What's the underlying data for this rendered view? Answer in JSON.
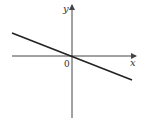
{
  "diagram": {
    "type": "coordinate-graph",
    "axes": {
      "x_label": "x",
      "y_label": "y",
      "origin_label": "0"
    },
    "line": {
      "passes_through_origin": true,
      "slope_sign": "negative"
    },
    "colors": {
      "axis": "#444444",
      "line": "#222222",
      "background": "#ffffff"
    }
  }
}
